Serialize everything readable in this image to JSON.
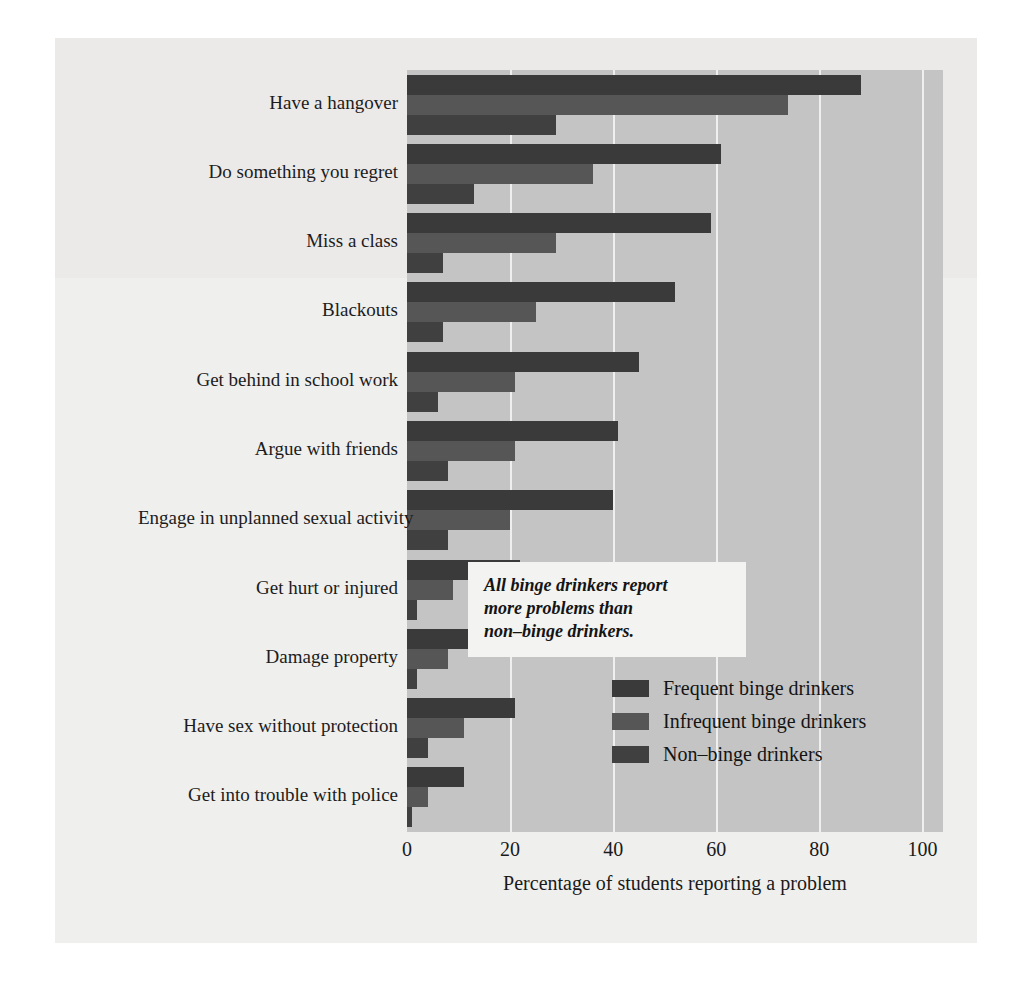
{
  "chart_data": {
    "type": "bar",
    "orientation": "horizontal",
    "grouped": true,
    "title": "",
    "xlabel": "Percentage of students reporting a problem",
    "ylabel": "",
    "xlim": [
      0,
      104
    ],
    "xticks": [
      0,
      20,
      40,
      60,
      80,
      100
    ],
    "xtick_labels": [
      "0",
      "20",
      "40",
      "60",
      "80",
      "100"
    ],
    "grid": "vertical",
    "legend_position": "inside-lower-right",
    "categories": [
      "Have a hangover",
      "Do something you regret",
      "Miss a class",
      "Blackouts",
      "Get behind in school work",
      "Argue with friends",
      "Engage in unplanned sexual activity",
      "Get hurt or injured",
      "Damage property",
      "Have sex without protection",
      "Get into trouble with police"
    ],
    "series": [
      {
        "name": "Frequent binge drinkers",
        "color": "#3a3a3a",
        "values": [
          88,
          61,
          59,
          52,
          45,
          41,
          40,
          22,
          22,
          21,
          11
        ]
      },
      {
        "name": "Infrequent binge drinkers",
        "color": "#565656",
        "values": [
          74,
          36,
          29,
          25,
          21,
          21,
          20,
          9,
          8,
          11,
          4
        ]
      },
      {
        "name": "Non–binge drinkers",
        "color": "#404040",
        "values": [
          29,
          13,
          7,
          7,
          6,
          8,
          8,
          2,
          2,
          4,
          1
        ]
      }
    ],
    "annotation": {
      "lines": [
        "All binge drinkers report",
        "more problems than",
        "non–binge drinkers."
      ]
    }
  }
}
